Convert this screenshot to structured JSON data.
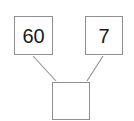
{
  "diagram": {
    "name": "number-bond",
    "type": "number-bond-diagram",
    "background_color": "#ffffff",
    "border_color": "#8f8f8f",
    "connector_color": "#8f8f8f",
    "text_color": "#1a1a1a",
    "nodes": [
      {
        "id": "addend-left",
        "role": "part",
        "value": "60",
        "empty": false
      },
      {
        "id": "addend-right",
        "role": "part",
        "value": "7",
        "empty": false
      },
      {
        "id": "sum",
        "role": "whole",
        "value": "",
        "empty": true
      }
    ],
    "connectors": [
      {
        "id": "connector-left",
        "from": "addend-left",
        "to": "sum"
      },
      {
        "id": "connector-right",
        "from": "addend-right",
        "to": "sum"
      }
    ]
  }
}
